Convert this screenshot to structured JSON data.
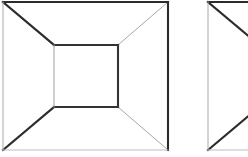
{
  "page": {
    "background_color": "#ffffff",
    "width": 248,
    "height": 157
  },
  "style": {
    "dark_color": "#2b2b2b",
    "mid_color": "#555555",
    "light_color": "#aaaaaa",
    "pale_color": "#bcbcbc",
    "thick_width": 2.1,
    "thin_width": 1.0
  },
  "figures": [
    {
      "id": "figure-1",
      "label": "Frustum Figure 1",
      "cropped": false,
      "outer_square": {
        "left": 3,
        "top": 2,
        "right": 168,
        "bottom": 150,
        "edges": {
          "top": {
            "weight": "thick",
            "color": "#2b2b2b"
          },
          "right": {
            "weight": "thick",
            "color": "#2b2b2b"
          },
          "bottom": {
            "weight": "thin",
            "color": "#bcbcbc"
          },
          "left": {
            "weight": "thin",
            "color": "#aaaaaa"
          }
        }
      },
      "inner_square": {
        "left": 54,
        "top": 45,
        "right": 118,
        "bottom": 107,
        "edges": {
          "top": {
            "weight": "thick",
            "color": "#333333"
          },
          "right": {
            "weight": "thick",
            "color": "#333333"
          },
          "bottom": {
            "weight": "thick",
            "color": "#333333"
          },
          "left": {
            "weight": "thin",
            "color": "#a0a0a0"
          }
        }
      },
      "diagonals": {
        "upper_left": {
          "weight": "thick",
          "color": "#2b2b2b"
        },
        "upper_right": {
          "weight": "thin",
          "color": "#a8a8a8"
        },
        "lower_left": {
          "weight": "thick",
          "color": "#2b2b2b"
        },
        "lower_right": {
          "weight": "thin",
          "color": "#a8a8a8"
        }
      }
    },
    {
      "id": "figure-2",
      "label": "Frustum Figure 2 (cropped)",
      "cropped": true,
      "outer_square": {
        "left": 208,
        "top": 2,
        "right": 373,
        "bottom": 150,
        "edges": {
          "top": {
            "weight": "thick",
            "color": "#2b2b2b"
          },
          "right": {
            "weight": "thick",
            "color": "#2b2b2b"
          },
          "bottom": {
            "weight": "thin",
            "color": "#bcbcbc"
          },
          "left": {
            "weight": "thin",
            "color": "#aaaaaa"
          }
        }
      },
      "inner_square": {
        "left": 259,
        "top": 45,
        "right": 323,
        "bottom": 107,
        "edges": {
          "top": {
            "weight": "thick",
            "color": "#333333"
          },
          "right": {
            "weight": "thick",
            "color": "#333333"
          },
          "bottom": {
            "weight": "thick",
            "color": "#333333"
          },
          "left": {
            "weight": "thin",
            "color": "#a0a0a0"
          }
        }
      },
      "diagonals": {
        "upper_left": {
          "weight": "thick",
          "color": "#2b2b2b"
        },
        "upper_right": {
          "weight": "thin",
          "color": "#a8a8a8"
        },
        "lower_left": {
          "weight": "thick",
          "color": "#2b2b2b"
        },
        "lower_right": {
          "weight": "thin",
          "color": "#a8a8a8"
        }
      }
    }
  ]
}
